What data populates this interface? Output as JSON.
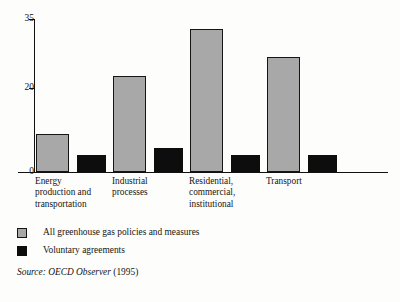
{
  "chart_data": {
    "type": "bar",
    "title": "",
    "subtitle": "",
    "xlabel": "",
    "ylabel": "",
    "ylim": [
      0,
      35
    ],
    "ytick_labels": [
      "0",
      "20",
      "35"
    ],
    "ytick_values": [
      0,
      20,
      35
    ],
    "grid": false,
    "legend_position": "below-axis-left",
    "categories": [
      "Energy production and transportation",
      "Industrial processes",
      "Residential, commercial, institutional",
      "Transport"
    ],
    "category_lines": [
      [
        "Energy",
        "production and",
        "transportation"
      ],
      [
        "Industrial",
        "processes"
      ],
      [
        "Residential,",
        "commercial,",
        "institutional"
      ],
      [
        "Transport"
      ]
    ],
    "series": [
      {
        "name": "All greenhouse gas policies and measures",
        "color": "#a8a8a8",
        "values": [
          8.7,
          22,
          32.7,
          26.3
        ]
      },
      {
        "name": "Voluntary agreements",
        "color": "#0d0d0d",
        "values": [
          3.8,
          5.5,
          3.8,
          3.8
        ]
      }
    ],
    "source_prefix": "Source:",
    "source_title": "OECD Observer",
    "source_year": "(1995)"
  },
  "legend": {
    "items": [
      {
        "label": "All greenhouse gas policies and measures",
        "swatch": "gray"
      },
      {
        "label": "Voluntary agreements",
        "swatch": "black"
      }
    ]
  },
  "axis": {
    "y_ticks": [
      {
        "label": "35",
        "value": 35
      },
      {
        "label": "20",
        "value": 20
      },
      {
        "label": "0",
        "value": 0
      }
    ]
  }
}
